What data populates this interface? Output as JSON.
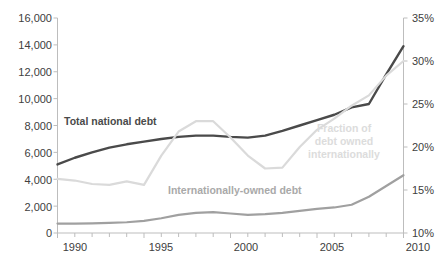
{
  "chart_data": {
    "type": "line",
    "title": "",
    "xlabel": "",
    "x": [
      1990,
      1991,
      1992,
      1993,
      1994,
      1995,
      1996,
      1997,
      1998,
      1999,
      2000,
      2001,
      2002,
      2003,
      2004,
      2005,
      2006,
      2007,
      2008,
      2009,
      2010
    ],
    "xlim": [
      1990,
      2010
    ],
    "xticks": [
      1990,
      1995,
      2000,
      2005,
      2010
    ],
    "xtick_labels": [
      "1990",
      "1995",
      "2000",
      "2005",
      "2010"
    ],
    "grid": false,
    "legend_position": "inline-annotations",
    "axes": [
      {
        "id": "left",
        "label": "",
        "ylim": [
          0,
          16000
        ],
        "yticks": [
          0,
          2000,
          4000,
          6000,
          8000,
          10000,
          12000,
          14000,
          16000
        ],
        "ytick_labels": [
          "0",
          "2,000",
          "4,000",
          "6,000",
          "8,000",
          "10,000",
          "12,000",
          "14,000",
          "16,000"
        ]
      },
      {
        "id": "right",
        "label": "",
        "ylim": [
          10,
          35
        ],
        "yticks": [
          10,
          15,
          20,
          25,
          30,
          35
        ],
        "ytick_labels": [
          "10%",
          "15%",
          "20%",
          "25%",
          "30%",
          "35%"
        ]
      }
    ],
    "series": [
      {
        "name": "Total national debt",
        "axis": "left",
        "color": "#4a4a4a",
        "width": 2.4,
        "values": [
          5100,
          5600,
          6000,
          6350,
          6600,
          6800,
          7000,
          7150,
          7250,
          7250,
          7150,
          7100,
          7250,
          7600,
          8000,
          8400,
          8800,
          9350,
          9600,
          11800,
          13900
        ]
      },
      {
        "name": "Internationally-owned debt",
        "axis": "left",
        "color": "#a0a0a0",
        "width": 2.2,
        "values": [
          700,
          700,
          720,
          760,
          800,
          900,
          1100,
          1350,
          1500,
          1550,
          1450,
          1350,
          1400,
          1500,
          1650,
          1800,
          1900,
          2100,
          2700,
          3500,
          4300
        ]
      },
      {
        "name": "Fraction of debt owned internationally",
        "axis": "right",
        "color": "#dadada",
        "width": 2.2,
        "values": [
          16.3,
          16.1,
          15.7,
          15.6,
          16.0,
          15.6,
          19.0,
          21.8,
          23.0,
          23.0,
          21.1,
          19.0,
          17.5,
          17.6,
          20.0,
          22.0,
          23.3,
          24.8,
          26.0,
          28.3,
          30.0
        ]
      }
    ],
    "annotations": [
      {
        "name": "total-national-debt-label",
        "text": "Total national debt",
        "color": "#4a4a4a"
      },
      {
        "name": "internationally-owned-debt-label",
        "text": "Internationally-owned debt",
        "color": "#a9a9a9"
      },
      {
        "name": "fraction-label-line1",
        "text": "Fraction of",
        "color": "#dcdcdc"
      },
      {
        "name": "fraction-label-line2",
        "text": "debt owned",
        "color": "#dcdcdc"
      },
      {
        "name": "fraction-label-line3",
        "text": "internationally",
        "color": "#dcdcdc"
      }
    ]
  },
  "labels": {
    "y_left": [
      "16,000",
      "14,000",
      "12,000",
      "10,000",
      "8,000",
      "6,000",
      "4,000",
      "2,000",
      "0"
    ],
    "y_right": [
      "35%",
      "30%",
      "25%",
      "20%",
      "15%",
      "10%"
    ],
    "x": [
      "1990",
      "1995",
      "2000",
      "2005",
      "2010"
    ],
    "series": {
      "total": "Total national debt",
      "international": "Internationally-owned debt",
      "fraction_l1": "Fraction of",
      "fraction_l2": "debt owned",
      "fraction_l3": "internationally"
    }
  },
  "colors": {
    "total": "#4a4a4a",
    "international": "#a0a0a0",
    "fraction": "#dadada",
    "axis": "#bdbdbd",
    "text": "#404040"
  }
}
